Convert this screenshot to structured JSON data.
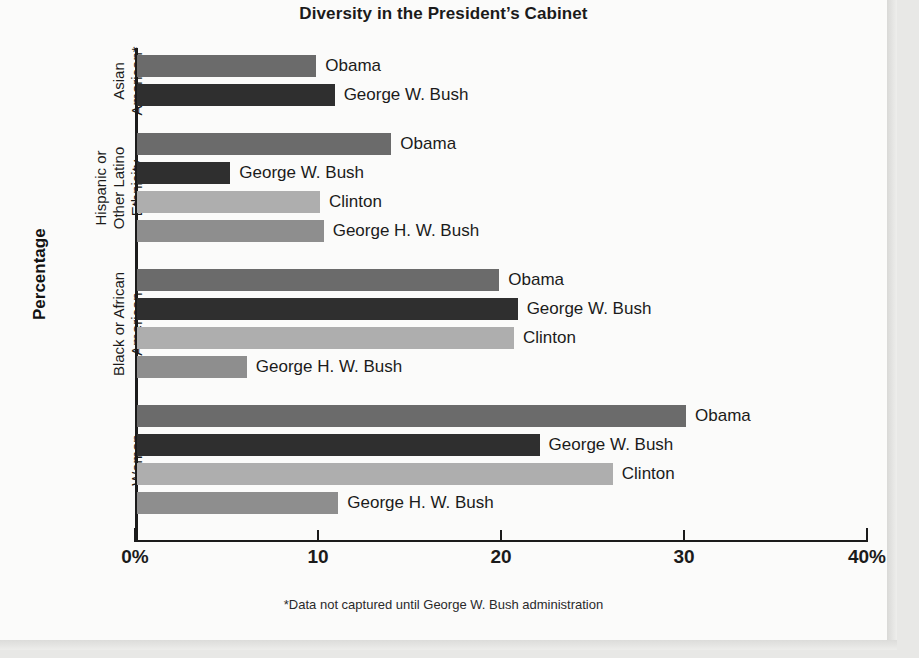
{
  "page": {
    "title": "Diversity in the President’s Cabinet",
    "footnote": "*Data not captured until George W. Bush administration",
    "axis_title": "Percentage"
  },
  "chart_data": {
    "type": "bar",
    "orientation": "horizontal",
    "title": "Diversity in the President’s Cabinet",
    "xlabel": "Percentage",
    "ylabel": "",
    "xlim": [
      0,
      40
    ],
    "xticks": [
      0,
      10,
      20,
      30,
      40
    ],
    "xtick_labels": [
      "0%",
      "10",
      "20",
      "30",
      "40%"
    ],
    "grid": false,
    "legend": "none (bars labeled inline)",
    "note": "*Data not captured until George W. Bush administration",
    "series_colors": {
      "Obama": "#6b6b6b",
      "George W. Bush": "#2f2f2f",
      "Clinton": "#aeaeae",
      "George H. W. Bush": "#8e8e8e"
    },
    "groups": [
      {
        "name": "Asian American*",
        "label_lines": [
          "Asian",
          "American*"
        ],
        "bars": [
          {
            "label": "Obama",
            "value": 9.8,
            "color": "#6b6b6b"
          },
          {
            "label": "George W. Bush",
            "value": 10.8,
            "color": "#2f2f2f"
          }
        ]
      },
      {
        "name": "Hispanic or Other Latino Ethnicity",
        "label_lines": [
          "Hispanic or",
          "Other Latino",
          "Ethnicity"
        ],
        "bars": [
          {
            "label": "Obama",
            "value": 13.9,
            "color": "#6b6b6b"
          },
          {
            "label": "George W. Bush",
            "value": 5.1,
            "color": "#2f2f2f"
          },
          {
            "label": "Clinton",
            "value": 10.0,
            "color": "#aeaeae"
          },
          {
            "label": "George H. W. Bush",
            "value": 10.2,
            "color": "#8e8e8e"
          }
        ]
      },
      {
        "name": "Black or African American",
        "label_lines": [
          "Black or African",
          "American"
        ],
        "bars": [
          {
            "label": "Obama",
            "value": 19.8,
            "color": "#6b6b6b"
          },
          {
            "label": "George W. Bush",
            "value": 20.8,
            "color": "#2f2f2f"
          },
          {
            "label": "Clinton",
            "value": 20.6,
            "color": "#aeaeae"
          },
          {
            "label": "George H. W. Bush",
            "value": 6.0,
            "color": "#8e8e8e"
          }
        ]
      },
      {
        "name": "Women",
        "label_lines": [
          "Women"
        ],
        "bars": [
          {
            "label": "Obama",
            "value": 30.0,
            "color": "#6b6b6b"
          },
          {
            "label": "George W. Bush",
            "value": 22.0,
            "color": "#2f2f2f"
          },
          {
            "label": "Clinton",
            "value": 26.0,
            "color": "#aeaeae"
          },
          {
            "label": "George H. W. Bush",
            "value": 11.0,
            "color": "#8e8e8e"
          }
        ]
      }
    ]
  }
}
